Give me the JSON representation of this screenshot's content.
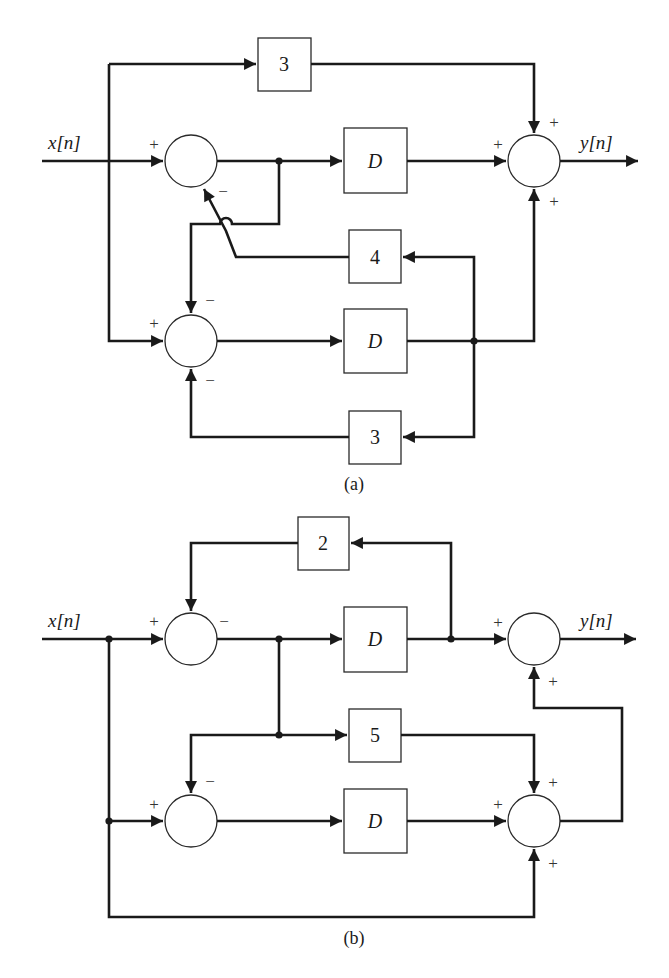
{
  "diagram_a": {
    "caption": "(a)",
    "input_label": "x[n]",
    "output_label": "y[n]",
    "blocks": {
      "feedforward_gain": "3",
      "delay_top": "D",
      "feedback_gain_top": "4",
      "delay_bottom": "D",
      "feedback_gain_bottom": "3"
    },
    "signs": {
      "sum1_input": "+",
      "sum1_feedback": "−",
      "out_top": "+",
      "out_left": "+",
      "out_bottom": "+",
      "sum2_top": "−",
      "sum2_input": "+",
      "sum2_bottom": "−"
    }
  },
  "diagram_b": {
    "caption": "(b)",
    "input_label": "x[n]",
    "output_label": "y[n]",
    "blocks": {
      "feedback_gain_top": "2",
      "delay_top": "D",
      "gain_middle": "5",
      "delay_bottom": "D"
    },
    "signs": {
      "sum1_input": "+",
      "sum1_feedback": "−",
      "out_left": "+",
      "out_bottom": "+",
      "sum2_top": "−",
      "sum2_input": "+",
      "sum3_top": "+",
      "sum3_left": "+",
      "sum3_bottom": "+"
    }
  }
}
